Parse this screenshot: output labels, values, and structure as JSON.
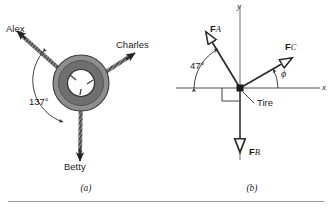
{
  "figure": {
    "panels": [
      {
        "id": "a",
        "caption": "(a)",
        "kind": "pictorial-tire-with-ropes",
        "object_label": "tire",
        "ropes": [
          {
            "name": "Alex",
            "label": "Alex",
            "direction_deg": 145,
            "arrowhead": "solid"
          },
          {
            "name": "Charles",
            "label": "Charles",
            "direction_deg": 28,
            "arrowhead": "solid"
          },
          {
            "name": "Betty",
            "label": "Betty",
            "direction_deg": 268,
            "arrowhead": "solid"
          }
        ],
        "angle_annotation": {
          "value": "137°",
          "between": [
            "Alex",
            "Betty"
          ]
        }
      },
      {
        "id": "b",
        "caption": "(b)",
        "kind": "free-body-vector-diagram",
        "axes": {
          "x_label": "x",
          "y_label": "y"
        },
        "origin_label": "Tire",
        "right_angle_marker": true,
        "vectors": [
          {
            "name": "F_A",
            "bold": "F",
            "sub": "A",
            "direction_deg": 133,
            "arrowhead": "hollow"
          },
          {
            "name": "F_C",
            "bold": "F",
            "sub": "C",
            "direction_deg": 28,
            "arrowhead": "hollow"
          },
          {
            "name": "F_B",
            "bold": "F",
            "sub": "B",
            "direction_deg": 270,
            "arrowhead": "hollow"
          }
        ],
        "angles": [
          {
            "label": "47°",
            "from": "-x axis",
            "to": "F_A"
          },
          {
            "label": "ϕ",
            "from": "+x axis",
            "to": "F_C"
          }
        ]
      }
    ]
  },
  "labels": {
    "alex": "Alex",
    "charles": "Charles",
    "betty": "Betty",
    "angle_137": "137°",
    "angle_47": "47°",
    "phi": "ϕ",
    "tire": "Tire",
    "axis_x": "x",
    "axis_y": "y",
    "caption_a": "(a)",
    "caption_b": "(b)",
    "force_f": "F",
    "sub_a": "A",
    "sub_b": "B",
    "sub_c": "C"
  },
  "colors": {
    "ink": "#1b1b1b",
    "tire_outer": "#8c8c8c",
    "tire_tread": "#6e6e6e",
    "rope": "#555555",
    "axis": "#8a8a8a",
    "rule": "#9a9a9a",
    "paper": "#ffffff"
  }
}
